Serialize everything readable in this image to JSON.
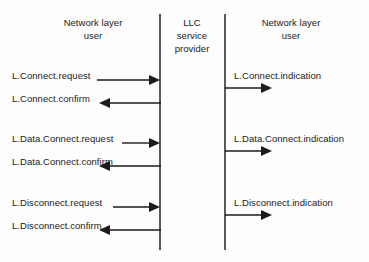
{
  "diagram": {
    "columns": [
      {
        "id": "left-user",
        "label": "Network layer\nuser"
      },
      {
        "id": "provider",
        "label": "LLC\nservice\nprovider"
      },
      {
        "id": "right-user",
        "label": "Network layer\nuser"
      }
    ],
    "colors": {
      "background": "#fdfdfd",
      "line": "#1b1b1b",
      "lifeline": "#555a5c",
      "text": "#1b1b1b"
    },
    "groups": [
      {
        "id": "connect",
        "left_request": {
          "label": "L.Connect.request",
          "direction": "right"
        },
        "left_confirm": {
          "label": "L.Connect.confirm",
          "direction": "left"
        },
        "right_indication": {
          "label": "L.Connect.indication",
          "direction": "right"
        }
      },
      {
        "id": "data-connect",
        "left_request": {
          "label": "L.Data.Connect.request",
          "direction": "right"
        },
        "left_confirm": {
          "label": "L.Data.Connect.confirm",
          "direction": "left"
        },
        "right_indication": {
          "label": "L.Data.Connect.indication",
          "direction": "right"
        }
      },
      {
        "id": "disconnect",
        "left_request": {
          "label": "L.Disconnect.request",
          "direction": "right"
        },
        "left_confirm": {
          "label": "L.Disconnect.confirm",
          "direction": "left"
        },
        "right_indication": {
          "label": "L.Disconnect.indication",
          "direction": "right"
        }
      }
    ]
  }
}
